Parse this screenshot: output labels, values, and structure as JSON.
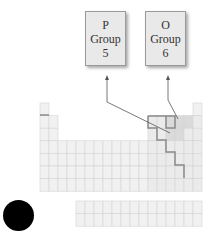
{
  "callouts": [
    {
      "symbol": "P",
      "group_label": "Group",
      "group_number": "5"
    },
    {
      "symbol": "O",
      "group_label": "Group",
      "group_number": "6"
    }
  ],
  "colors": {
    "cell_fill": "#f1f1f1",
    "cell_line": "#d4d4d4",
    "highlight_fill": "#dadada",
    "staircase": "#8a8a8a",
    "arrow": "#555555",
    "marker": "#000000"
  },
  "periodic_table": {
    "columns": 18,
    "rows": 7,
    "f_block_rows": 2,
    "f_block_columns": 14
  }
}
